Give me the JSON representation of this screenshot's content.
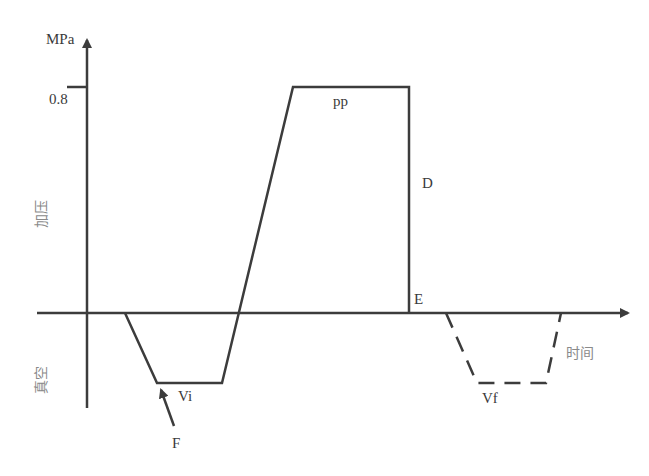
{
  "diagram": {
    "type": "pressure-time process diagram",
    "axes": {
      "y_unit": "MPa",
      "y_tick": "0.8",
      "x_label": "时间",
      "upper_region_label": "加压",
      "lower_region_label": "真空"
    },
    "points": {
      "pp": "pp",
      "D": "D",
      "E": "E",
      "Vi": "Vi",
      "Vf": "Vf",
      "F": "F"
    },
    "colors": {
      "line": "#3c3c3c",
      "text": "#3a3a3a",
      "cjk_text": "#8a8a8a",
      "background": "#ffffff"
    }
  }
}
